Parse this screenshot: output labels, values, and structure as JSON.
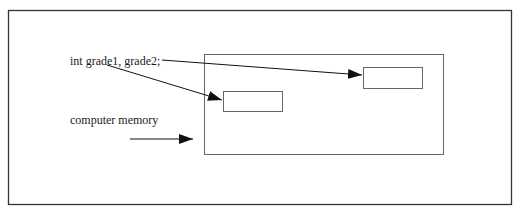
{
  "diagram": {
    "declaration_label": "int grade1, grade2;",
    "memory_label": "computer memory",
    "memory_box": {
      "name": "computer-memory",
      "cells": [
        {
          "name": "grade1",
          "value": ""
        },
        {
          "name": "grade2",
          "value": ""
        }
      ]
    },
    "arrows": [
      {
        "from": "declaration",
        "to": "grade1-cell"
      },
      {
        "from": "declaration",
        "to": "grade2-cell"
      },
      {
        "from": "memory-label",
        "to": "memory-box"
      }
    ],
    "colors": {
      "frame": "#333333",
      "box": "#666666",
      "arrow": "#111111"
    }
  }
}
